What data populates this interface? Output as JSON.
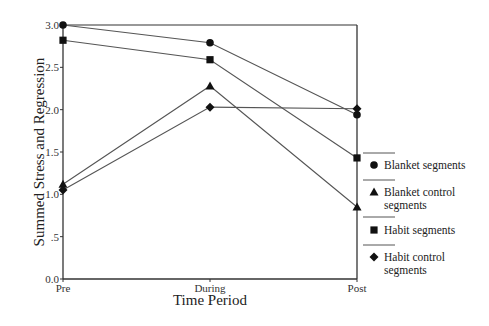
{
  "chart_data": {
    "type": "line",
    "title": "",
    "xlabel": "Time Period",
    "ylabel": "Summed Stress and Regression",
    "categories": [
      "Pre",
      "During",
      "Post"
    ],
    "ylim": [
      0.0,
      3.0
    ],
    "yticks": [
      "0.0",
      ".5",
      "1.0",
      "1.5",
      "2.0",
      "2.5",
      "3.0"
    ],
    "grid": false,
    "legend_position": "right",
    "series": [
      {
        "name": "Blanket segments",
        "marker": "circle",
        "values": [
          3.0,
          2.79,
          1.94
        ]
      },
      {
        "name": "Blanket control segments",
        "marker": "triangle",
        "values": [
          1.12,
          2.28,
          0.85
        ]
      },
      {
        "name": "Habit segments",
        "marker": "square",
        "values": [
          2.82,
          2.59,
          1.43
        ]
      },
      {
        "name": "Habit control segments",
        "marker": "diamond",
        "values": [
          1.05,
          2.03,
          2.01
        ]
      }
    ]
  },
  "legend": {
    "items": [
      {
        "line1": "Blanket segments",
        "line2": ""
      },
      {
        "line1": "Blanket control",
        "line2": "segments"
      },
      {
        "line1": "Habit segments",
        "line2": ""
      },
      {
        "line1": "Habit control",
        "line2": "segments"
      }
    ]
  }
}
